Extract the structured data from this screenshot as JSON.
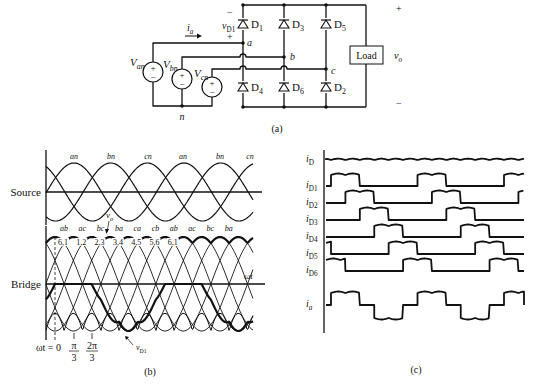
{
  "figure": {
    "panel_a": {
      "caption": "(a)",
      "diodes": [
        {
          "id": "D1",
          "label": "D",
          "sub": "1",
          "col": 0,
          "pos": "top"
        },
        {
          "id": "D3",
          "label": "D",
          "sub": "3",
          "col": 1,
          "pos": "top"
        },
        {
          "id": "D5",
          "label": "D",
          "sub": "5",
          "col": 2,
          "pos": "top"
        },
        {
          "id": "D4",
          "label": "D",
          "sub": "4",
          "col": 0,
          "pos": "bottom"
        },
        {
          "id": "D6",
          "label": "D",
          "sub": "6",
          "col": 1,
          "pos": "bottom"
        },
        {
          "id": "D2",
          "label": "D",
          "sub": "2",
          "col": 2,
          "pos": "bottom"
        }
      ],
      "sources": [
        {
          "id": "Van",
          "label": "V",
          "sub": "an"
        },
        {
          "id": "Vbn",
          "label": "V",
          "sub": "bn"
        },
        {
          "id": "Vcn",
          "label": "V",
          "sub": "cn"
        }
      ],
      "nodes": {
        "a": "a",
        "b": "b",
        "c": "c",
        "n": "n"
      },
      "current_label": {
        "main": "i",
        "sub": "a"
      },
      "diode_voltage": {
        "main": "v",
        "sub": "D1",
        "minus": "−",
        "plus": "+"
      },
      "load_label": "Load",
      "output_voltage": {
        "main": "v",
        "sub": "o",
        "plus": "+",
        "minus": "−"
      }
    },
    "panel_b": {
      "caption": "(b)",
      "source_label": "Source",
      "bridge_label": "Bridge",
      "source_peaks": [
        "an",
        "bn",
        "cn",
        "an",
        "bn",
        "cn"
      ],
      "line_labels": [
        "ab",
        "ac",
        "bc",
        "ba",
        "ca",
        "cb",
        "ab",
        "ac",
        "bc",
        "ba"
      ],
      "diode_pairs": [
        "6,1",
        "1,2",
        "2,3",
        "3,4",
        "4,5",
        "5,6",
        "6,1"
      ],
      "vo_label": {
        "main": "v",
        "sub": "o"
      },
      "vd1_label": {
        "main": "v",
        "sub": "D1"
      },
      "axis_label": "ωt",
      "ticks": [
        {
          "label": "ωt = 0"
        },
        {
          "num": "π",
          "den": "3"
        },
        {
          "num": "2π",
          "den": "3"
        }
      ]
    },
    "panel_c": {
      "caption": "(c)",
      "traces": [
        {
          "main": "i",
          "sub": "D"
        },
        {
          "main": "i",
          "sub": "D1"
        },
        {
          "main": "i",
          "sub": "D2"
        },
        {
          "main": "i",
          "sub": "D3"
        },
        {
          "main": "i",
          "sub": "D4"
        },
        {
          "main": "i",
          "sub": "D5"
        },
        {
          "main": "i",
          "sub": "D6"
        },
        {
          "main": "i",
          "sub": "a"
        }
      ]
    },
    "colors": {
      "ink": "#111111",
      "background": "#ffffff"
    }
  }
}
